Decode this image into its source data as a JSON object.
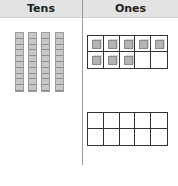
{
  "headers": {
    "tens": "Tens",
    "ones": "Ones"
  },
  "tens": {
    "rods": 4,
    "units_per_rod": 10
  },
  "ones": {
    "frames": [
      {
        "filled": 8,
        "total": 10
      },
      {
        "filled": 0,
        "total": 10
      }
    ]
  }
}
